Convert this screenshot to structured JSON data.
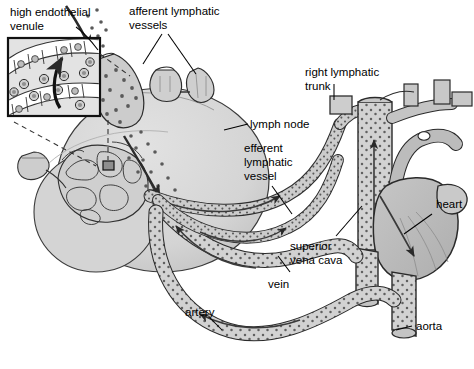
{
  "figure": {
    "type": "anatomical-diagram",
    "background_color": "#ffffff",
    "ink_color": "#000000",
    "palette": {
      "lymph_node_fill": "#d6d6d6",
      "lymph_node_shadow": "#bdbdbd",
      "vessel_fill": "#d2d2d2",
      "vessel_dark": "#a8a8a8",
      "heart_fill": "#b9b9b9",
      "heart_light": "#cfcfcf",
      "inset_fill": "#e2e2e2",
      "inset_border": "#1a1a1a",
      "stipple": "#555555"
    }
  },
  "labels": {
    "high_endothelial_venule": "high endothelial\nvenule",
    "high_endothelial_venule_line1": "high endothelial",
    "high_endothelial_venule_line2": "venule",
    "afferent_lymphatic_vessels_line1": "afferent lymphatic",
    "afferent_lymphatic_vessels_line2": "vessels",
    "lymph_node": "lymph node",
    "right_lymphatic_trunk_line1": "right lymphatic",
    "right_lymphatic_trunk_line2": "trunk",
    "efferent_lymphatic_vessel_line1": "efferent",
    "efferent_lymphatic_vessel_line2": "lymphatic",
    "efferent_lymphatic_vessel_line3": "vessel",
    "heart": "heart",
    "superior_vena_cava_line1": "superior",
    "superior_vena_cava_line2": "vena cava",
    "vein": "vein",
    "artery": "artery",
    "aorta": "aorta"
  },
  "structures": [
    {
      "name": "high-endothelial-venule-inset",
      "description": "Boxed magnified view of a high endothelial venule showing cuboidal endothelial cells and lymphocytes migrating across the wall"
    },
    {
      "name": "afferent-lymphatic-vessels",
      "description": "Two short vessel stubs entering the top of the lymph node"
    },
    {
      "name": "lymph-node",
      "description": "Large oval lymph node with internal reticular network and hilum"
    },
    {
      "name": "efferent-lymphatic-vessel",
      "description": "Vessel leaving the lymph node hilum toward the right lymphatic trunk"
    },
    {
      "name": "right-lymphatic-trunk",
      "description": "Lymphatic trunk draining into the venous angle"
    },
    {
      "name": "superior-vena-cava",
      "description": "Great vein returning blood to the right atrium"
    },
    {
      "name": "heart",
      "description": "Heart receiving venous return and ejecting into the aorta"
    },
    {
      "name": "aorta",
      "description": "Main systemic artery leaving the heart"
    },
    {
      "name": "vein",
      "description": "Systemic vein carrying blood toward the heart"
    },
    {
      "name": "artery",
      "description": "Systemic artery carrying blood away from the heart"
    }
  ]
}
